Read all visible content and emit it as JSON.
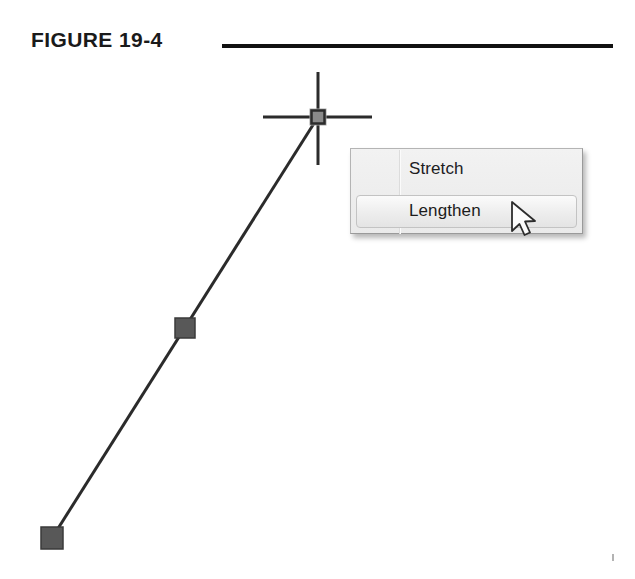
{
  "figure": {
    "caption": "FIGURE 19-4",
    "rule_color": "#111111"
  },
  "drawing": {
    "type": "cad-line-with-grips",
    "background": "#ffffff",
    "line": {
      "name": "selected-line",
      "color": "#2b2b2b",
      "width": 3,
      "start": {
        "x": 52,
        "y": 538
      },
      "end": {
        "x": 318,
        "y": 117
      }
    },
    "grips": [
      {
        "name": "grip-endpoint-bottom",
        "x": 52,
        "y": 538,
        "size": 22,
        "style": "filled",
        "fill": "#585858",
        "stroke": "#3a3a3a"
      },
      {
        "name": "grip-midpoint",
        "x": 185,
        "y": 328,
        "size": 20,
        "style": "filled",
        "fill": "#585858",
        "stroke": "#3a3a3a"
      },
      {
        "name": "grip-endpoint-top",
        "x": 318,
        "y": 117,
        "size": 13,
        "style": "hot",
        "fill": "#8a8a8a",
        "stroke": "#2b2b2b"
      }
    ],
    "crosshair": {
      "name": "crosshair-cursor",
      "center": {
        "x": 318,
        "y": 117
      },
      "color": "#2b2b2b",
      "horizontal": {
        "x1": 263,
        "x2": 372
      },
      "vertical": {
        "y1": 72,
        "y2": 165
      }
    }
  },
  "context_menu": {
    "name": "grip-context-menu",
    "background": "#ededed",
    "border_color": "#9a9a9a",
    "items": [
      {
        "label": "Stretch",
        "selected": false
      },
      {
        "label": "Lengthen",
        "selected": true
      }
    ]
  },
  "cursor": {
    "name": "mouse-pointer",
    "type": "arrow",
    "x": 512,
    "y": 202
  }
}
